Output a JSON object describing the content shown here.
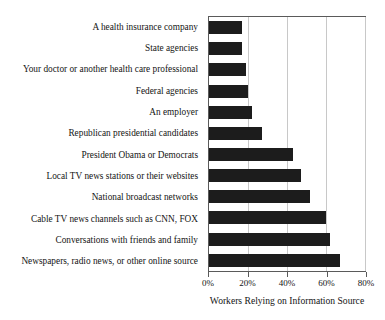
{
  "chart_data": {
    "type": "bar",
    "orientation": "horizontal",
    "title": "",
    "xlabel": "Workers Relying on Information Source",
    "ylabel": "",
    "xlim": [
      0,
      80
    ],
    "xticks": [
      0,
      20,
      40,
      60,
      80
    ],
    "xtick_labels": [
      "0%",
      "20%",
      "40%",
      "60%",
      "80%"
    ],
    "grid": true,
    "legend": "none",
    "bar_color": "#1c1c1c",
    "categories": [
      "A health insurance company",
      "State agencies",
      "Your doctor or another health care professional",
      "Federal agencies",
      "An employer",
      "Republican presidential candidates",
      "President Obama or Democrats",
      "Local TV news stations or their websites",
      "National broadcast networks",
      "Cable TV news channels such as CNN, FOX",
      "Conversations with friends and family",
      "Newspapers, radio news, or other online source"
    ],
    "values": [
      17,
      17,
      19,
      20,
      22,
      27,
      43,
      47,
      52,
      60,
      62,
      67
    ]
  }
}
